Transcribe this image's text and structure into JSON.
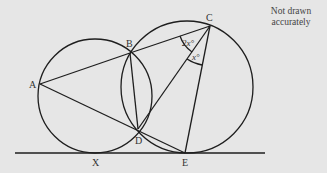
{
  "diagram": {
    "note_line1": "Not drawn",
    "note_line2": "accurately",
    "points": {
      "A": "A",
      "B": "B",
      "C": "C",
      "D": "D",
      "E": "E",
      "X": "X"
    },
    "angles": {
      "BCD": "2x°",
      "DCE": "x°"
    },
    "colors": {
      "background": "#e6e6e6",
      "stroke": "#1e1e1e"
    }
  }
}
